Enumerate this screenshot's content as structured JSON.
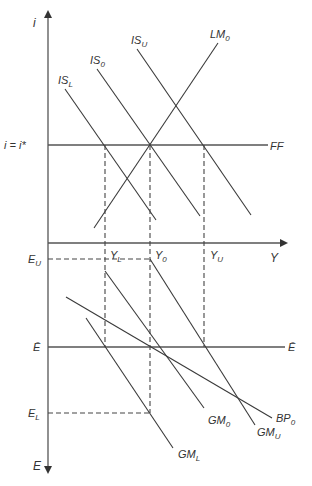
{
  "diagram": {
    "colors": {
      "line": "#3a3a3a",
      "axis": "#555555",
      "text": "#333333",
      "background": "#ffffff"
    },
    "axes": {
      "top_vertical_label": "i",
      "bottom_vertical_label": "E",
      "horizontal_label": "Y"
    },
    "top_panel": {
      "interest_line_label": "i = i*",
      "ff_label": "FF",
      "curves": [
        {
          "id": "IS_L",
          "base": "IS",
          "sub": "L"
        },
        {
          "id": "IS_0",
          "base": "IS",
          "sub": "0"
        },
        {
          "id": "IS_U",
          "base": "IS",
          "sub": "U"
        },
        {
          "id": "LM_0",
          "base": "LM",
          "sub": "0"
        }
      ]
    },
    "income_levels": [
      {
        "id": "Y_L",
        "base": "Y",
        "sub": "L"
      },
      {
        "id": "Y_0",
        "base": "Y",
        "sub": "0"
      },
      {
        "id": "Y_U",
        "base": "Y",
        "sub": "U"
      }
    ],
    "bottom_panel": {
      "e_levels": [
        {
          "id": "E_U",
          "base": "E",
          "sub": "U"
        },
        {
          "id": "E_bar",
          "base": "Ē",
          "sub": ""
        },
        {
          "id": "E_L",
          "base": "E",
          "sub": "L"
        }
      ],
      "e_bar_right_label": "Ē",
      "curves": [
        {
          "id": "GM_L",
          "base": "GM",
          "sub": "L"
        },
        {
          "id": "GM_0",
          "base": "GM",
          "sub": "0"
        },
        {
          "id": "GM_U",
          "base": "GM",
          "sub": "U"
        },
        {
          "id": "BP_0",
          "base": "BP",
          "sub": "0"
        }
      ]
    }
  }
}
